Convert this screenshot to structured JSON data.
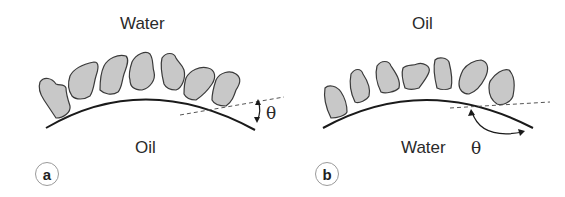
{
  "figure": {
    "panels": [
      {
        "id": "a",
        "badge": "a",
        "top_phase": "Water",
        "bottom_phase": "Oil",
        "angle_symbol": "θ",
        "angle_description": "small contact angle (< 90°), measured through water side"
      },
      {
        "id": "b",
        "badge": "b",
        "top_phase": "Oil",
        "bottom_phase": "Water",
        "angle_symbol": "θ",
        "angle_description": "large contact angle (> 90°), measured through water side"
      }
    ],
    "colors": {
      "particle_fill": "#c8c8c8",
      "particle_stroke": "#3a3a3a",
      "interface_line": "#1a1a1a",
      "tangent_dashed": "#555555",
      "text": "#2a2a2a",
      "badge_border": "#9a9a9a"
    }
  }
}
